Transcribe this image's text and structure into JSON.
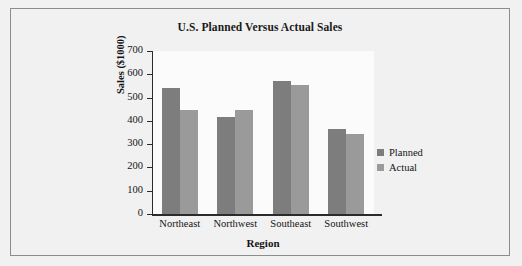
{
  "chart_data": {
    "type": "bar",
    "title": "U.S. Planned Versus Actual Sales",
    "xlabel": "Region",
    "ylabel": "Sales ($1000)",
    "categories": [
      "Northeast",
      "Northwest",
      "Southeast",
      "Southwest"
    ],
    "series": [
      {
        "name": "Planned",
        "color": "#7d7d7d",
        "values": [
          540,
          415,
          570,
          365
        ]
      },
      {
        "name": "Actual",
        "color": "#9a9a9a",
        "values": [
          445,
          445,
          555,
          345
        ]
      }
    ],
    "ylim": [
      0,
      700
    ],
    "ytick_step": 100,
    "yticks": [
      0,
      100,
      200,
      300,
      400,
      500,
      600,
      700
    ],
    "grid": false,
    "legend_position": "right"
  },
  "figure": {
    "background_color": "#f1f1f1",
    "plot_background_color": "#fbfbfb",
    "border_color": "#8d8d8d"
  }
}
